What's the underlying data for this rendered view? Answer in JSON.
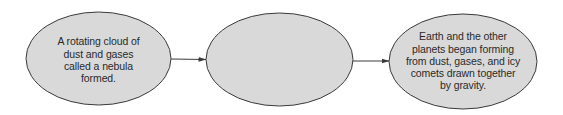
{
  "diagram": {
    "type": "flowchart",
    "direction": "left-to-right",
    "colors": {
      "node_fill": "#d9d9d9",
      "node_stroke": "#3a3a3a",
      "arrow": "#3a3a3a",
      "text": "#2a2a2a",
      "background": "#ffffff"
    },
    "nodes": [
      {
        "id": "node-1",
        "text": "A rotating cloud of dust and gases called a nebula formed.",
        "lines": [
          "A rotating cloud of",
          "dust and gases",
          "called a nebula",
          "formed."
        ]
      },
      {
        "id": "node-2",
        "text": "",
        "lines": []
      },
      {
        "id": "node-3",
        "text": "Earth and the other planets began forming from dust, gases, and icy comets drawn together by gravity.",
        "lines": [
          "Earth and the other",
          "planets began forming",
          "from dust, gases, and icy",
          "comets drawn together",
          "by gravity."
        ]
      }
    ],
    "edges": [
      {
        "from": "node-1",
        "to": "node-2"
      },
      {
        "from": "node-2",
        "to": "node-3"
      }
    ]
  }
}
